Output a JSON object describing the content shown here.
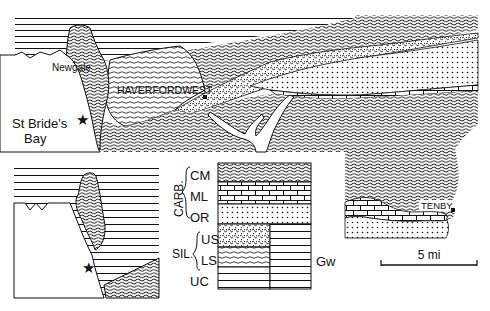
{
  "map": {
    "places": {
      "newgale": "Newgale",
      "haverfordwest": "HAVERFORDWEST",
      "st_brides_bay_line1": "St Bride's",
      "st_brides_bay_line2": "Bay",
      "tenby": "TENBY"
    },
    "scale_bar": {
      "label": "5 mi"
    }
  },
  "legend": {
    "groups": [
      {
        "label": "CARB.",
        "units": [
          "CM",
          "ML",
          "OR"
        ]
      },
      {
        "label": "SIL.",
        "units": [
          "US",
          "LS"
        ]
      }
    ],
    "units": [
      {
        "code": "CM",
        "pattern": "wavy-lines"
      },
      {
        "code": "ML",
        "pattern": "brick"
      },
      {
        "code": "OR",
        "pattern": "dots"
      },
      {
        "code": "US",
        "pattern": "stipple-dense"
      },
      {
        "code": "LS",
        "pattern": "wavy-open"
      },
      {
        "code": "UC",
        "pattern": "horizontal-lines"
      }
    ],
    "side_unit": {
      "code": "Gw",
      "pattern": "horizontal-lines"
    }
  }
}
